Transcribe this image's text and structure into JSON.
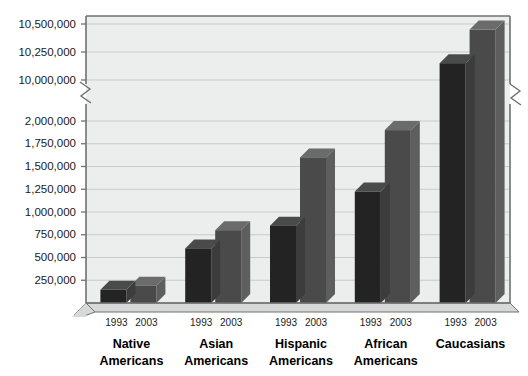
{
  "chart_data": {
    "type": "bar",
    "title": "",
    "subtitle": "",
    "xlabel": "",
    "ylabel": "",
    "grid": true,
    "legend_position": "none",
    "axis_break": true,
    "axis_break_note": "y-axis broken between 2,000,000 and 10,000,000",
    "ytick_labels": [
      "10,500,000",
      "10,250,000",
      "10,000,000",
      "2,000,000",
      "1,750,000",
      "1,500,000",
      "1,250,000",
      "1,000,000",
      "750,000",
      "500,000",
      "250,000"
    ],
    "ytick_values": [
      10500000,
      10250000,
      10000000,
      2000000,
      1750000,
      1500000,
      1250000,
      1000000,
      750000,
      500000,
      250000
    ],
    "ylim_lower": [
      0,
      2000000
    ],
    "ylim_upper": [
      10000000,
      10500000
    ],
    "categories": [
      "Native Americans",
      "Asian Americans",
      "Hispanic Americans",
      "African Americans",
      "Caucasians"
    ],
    "category_lines": [
      [
        "Native",
        "Americans"
      ],
      [
        "Asian",
        "Americans"
      ],
      [
        "Hispanic",
        "Americans"
      ],
      [
        "African",
        "Americans"
      ],
      [
        "Caucasians",
        ""
      ]
    ],
    "series": [
      {
        "name": "1993",
        "color": "#2b2b2b",
        "values": [
          145000,
          600000,
          850000,
          1225000,
          10150000
        ]
      },
      {
        "name": "2003",
        "color": "#4d4d4d",
        "values": [
          190000,
          800000,
          1600000,
          1900000,
          10450000
        ]
      }
    ],
    "colors": {
      "plot_background": "#eceded",
      "gridline": "#c9cbcb",
      "axis": "#6f7170",
      "floor": "#d7d8d8",
      "bar_1993_front": "#232323",
      "bar_1993_side": "#3c3c3c",
      "bar_1993_top": "#4a4a4a",
      "bar_2003_front": "#4a4a4a",
      "bar_2003_side": "#5e5e5e",
      "bar_2003_top": "#6b6b6b",
      "text": "#111111"
    }
  }
}
